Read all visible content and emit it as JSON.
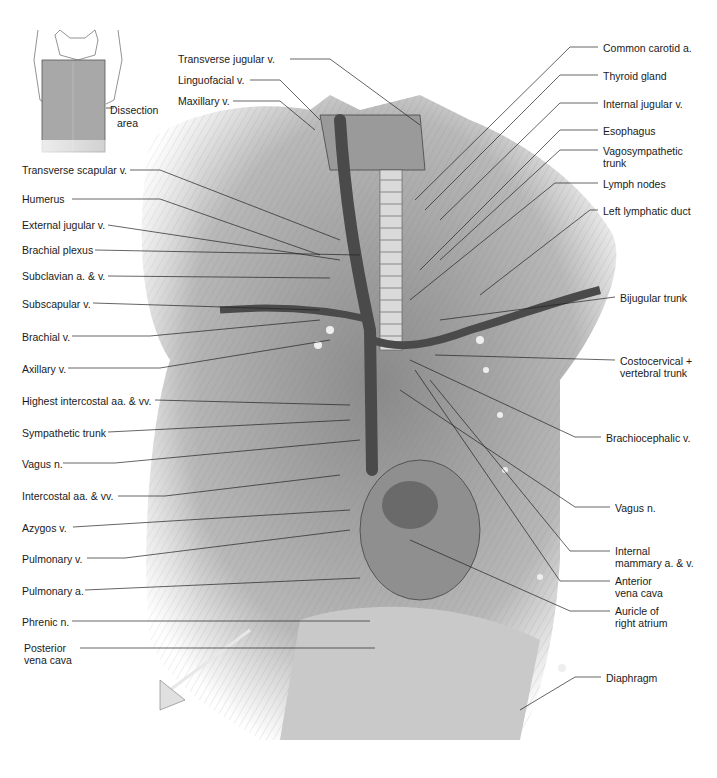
{
  "figure": {
    "inset": {
      "label_line1": "Dissection",
      "label_line2": "area"
    },
    "left_labels": [
      {
        "id": "transverse-scapular-v",
        "text": "Transverse scapular v.",
        "x": 22,
        "y": 164
      },
      {
        "id": "humerus",
        "text": "Humerus",
        "x": 22,
        "y": 193
      },
      {
        "id": "external-jugular-v",
        "text": "External jugular v.",
        "x": 22,
        "y": 219
      },
      {
        "id": "brachial-plexus",
        "text": "Brachial plexus",
        "x": 22,
        "y": 244
      },
      {
        "id": "subclavian-a-v",
        "text": "Subclavian a. & v.",
        "x": 22,
        "y": 270
      },
      {
        "id": "subscapular-v",
        "text": "Subscapular v.",
        "x": 22,
        "y": 298
      },
      {
        "id": "brachial-v",
        "text": "Brachial v.",
        "x": 22,
        "y": 331
      },
      {
        "id": "axillary-v",
        "text": "Axillary v.",
        "x": 22,
        "y": 363
      },
      {
        "id": "highest-intercostal",
        "text": "Highest intercostal aa. & vv.",
        "x": 22,
        "y": 395
      },
      {
        "id": "sympathetic-trunk",
        "text": "Sympathetic trunk",
        "x": 22,
        "y": 427
      },
      {
        "id": "vagus-n-left",
        "text": "Vagus n.",
        "x": 22,
        "y": 458
      },
      {
        "id": "intercostal-aa-vv",
        "text": "Intercostal aa. & vv.",
        "x": 22,
        "y": 490
      },
      {
        "id": "azygos-v",
        "text": "Azygos v.",
        "x": 22,
        "y": 522
      },
      {
        "id": "pulmonary-v",
        "text": "Pulmonary v.",
        "x": 22,
        "y": 553
      },
      {
        "id": "pulmonary-a",
        "text": "Pulmonary a.",
        "x": 22,
        "y": 585
      },
      {
        "id": "phrenic-n",
        "text": "Phrenic n.",
        "x": 22,
        "y": 616
      },
      {
        "id": "posterior-vena-cava-1",
        "text": "Posterior",
        "x": 24,
        "y": 642
      },
      {
        "id": "posterior-vena-cava-2",
        "text": "vena cava",
        "x": 24,
        "y": 654
      }
    ],
    "top_labels": [
      {
        "id": "transverse-jugular-v",
        "text": "Transverse jugular v.",
        "x": 178,
        "y": 53
      },
      {
        "id": "linguofacial-v",
        "text": "Linguofacial v.",
        "x": 178,
        "y": 74
      },
      {
        "id": "maxillary-v",
        "text": "Maxillary v.",
        "x": 178,
        "y": 95
      }
    ],
    "right_labels": [
      {
        "id": "common-carotid-a",
        "text": "Common carotid a.",
        "x": 603,
        "y": 42
      },
      {
        "id": "thyroid-gland",
        "text": "Thyroid gland",
        "x": 603,
        "y": 70
      },
      {
        "id": "internal-jugular-v",
        "text": "Internal jugular v.",
        "x": 603,
        "y": 98
      },
      {
        "id": "esophagus",
        "text": "Esophagus",
        "x": 603,
        "y": 125
      },
      {
        "id": "vagosympathetic-trunk-1",
        "text": "Vagosympathetic",
        "x": 603,
        "y": 145
      },
      {
        "id": "vagosympathetic-trunk-2",
        "text": "trunk",
        "x": 603,
        "y": 157
      },
      {
        "id": "lymph-nodes",
        "text": "Lymph nodes",
        "x": 603,
        "y": 178
      },
      {
        "id": "left-lymphatic-duct",
        "text": "Left lymphatic duct",
        "x": 603,
        "y": 205
      },
      {
        "id": "bijugular-trunk",
        "text": "Bijugular trunk",
        "x": 620,
        "y": 292
      },
      {
        "id": "costocervical-1",
        "text": "Costocervical +",
        "x": 620,
        "y": 355
      },
      {
        "id": "costocervical-2",
        "text": "vertebral trunk",
        "x": 620,
        "y": 367
      },
      {
        "id": "brachiocephalic-v",
        "text": "Brachiocephalic v.",
        "x": 606,
        "y": 432
      },
      {
        "id": "vagus-n-right",
        "text": "Vagus n.",
        "x": 615,
        "y": 502
      },
      {
        "id": "internal-mammary-1",
        "text": "Internal",
        "x": 615,
        "y": 545
      },
      {
        "id": "internal-mammary-2",
        "text": "mammary a. & v.",
        "x": 615,
        "y": 557
      },
      {
        "id": "anterior-vena-cava-1",
        "text": "Anterior",
        "x": 615,
        "y": 575
      },
      {
        "id": "anterior-vena-cava-2",
        "text": "vena cava",
        "x": 615,
        "y": 587
      },
      {
        "id": "auricle-1",
        "text": "Auricle of",
        "x": 615,
        "y": 605
      },
      {
        "id": "auricle-2",
        "text": "right atrium",
        "x": 615,
        "y": 617
      },
      {
        "id": "diaphragm",
        "text": "Diaphragm",
        "x": 606,
        "y": 672
      }
    ]
  },
  "colors": {
    "tissue_light": "#d4d4d4",
    "tissue_mid": "#9a9a9a",
    "tissue_dark": "#555555",
    "vessel": "#4a4a4a",
    "leader": "#222222",
    "inset_fill": "#a8a8a8"
  }
}
